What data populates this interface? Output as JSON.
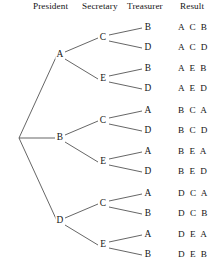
{
  "headers": {
    "president": "President",
    "secretary": "Secretary",
    "treasurer": "Treasurer",
    "result": "Result"
  },
  "tree": {
    "root_label": "",
    "level1": [
      {
        "label": "A"
      },
      {
        "label": "B"
      },
      {
        "label": "D"
      }
    ],
    "level2": [
      {
        "label": "C"
      },
      {
        "label": "E"
      },
      {
        "label": "C"
      },
      {
        "label": "E"
      },
      {
        "label": "C"
      },
      {
        "label": "E"
      }
    ],
    "level3": [
      {
        "label": "B"
      },
      {
        "label": "D"
      },
      {
        "label": "B"
      },
      {
        "label": "D"
      },
      {
        "label": "A"
      },
      {
        "label": "D"
      },
      {
        "label": "A"
      },
      {
        "label": "D"
      },
      {
        "label": "A"
      },
      {
        "label": "B"
      },
      {
        "label": "A"
      },
      {
        "label": "B"
      }
    ]
  },
  "results": [
    {
      "text": "A C B"
    },
    {
      "text": "A C D"
    },
    {
      "text": "A E B"
    },
    {
      "text": "A E D"
    },
    {
      "text": "B C A"
    },
    {
      "text": "B C D"
    },
    {
      "text": "B E A"
    },
    {
      "text": "B E D"
    },
    {
      "text": "D C A"
    },
    {
      "text": "D C B"
    },
    {
      "text": "D E A"
    },
    {
      "text": "D E B"
    }
  ],
  "colors": {
    "line": "#4a4a4a",
    "text": "#141414",
    "background": "#ffffff"
  }
}
